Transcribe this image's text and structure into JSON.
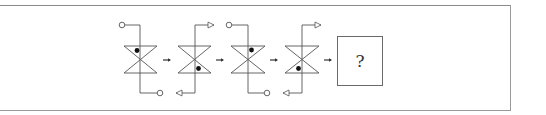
{
  "puzzle": {
    "type": "figure-sequence",
    "answer_placeholder": "?",
    "colors": {
      "stroke": "#555555",
      "dot": "#111111",
      "frame": "#9a9a9a"
    },
    "figures": [
      {
        "index": 1,
        "center_x": 140,
        "dot": "upper-left",
        "top_terminal": "circle-left",
        "bottom_terminal": "circle-right"
      },
      {
        "index": 2,
        "center_x": 195,
        "dot": "lower-right",
        "top_terminal": "arrow-right",
        "bottom_terminal": "arrow-left"
      },
      {
        "index": 3,
        "center_x": 248,
        "dot": "upper-right",
        "top_terminal": "circle-left",
        "bottom_terminal": "circle-right"
      },
      {
        "index": 4,
        "center_x": 302,
        "dot": "lower-left",
        "top_terminal": "arrow-right",
        "bottom_terminal": "arrow-left"
      }
    ],
    "arrows": [
      "→",
      "→",
      "→",
      "→"
    ]
  }
}
